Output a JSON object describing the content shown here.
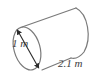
{
  "figure": {
    "name": "cylinder-diagram",
    "shape": "cylinder",
    "background_color": "#ffffff",
    "stroke_color": "#7a7a7a",
    "arrow_color": "#2b2b2b",
    "text_color": "#3c3c3c",
    "labels": {
      "diameter": "1 m",
      "length": "2.1 m"
    },
    "annotations": {
      "diameter_arrow": "double-headed-arrow",
      "diameter_value": 1,
      "diameter_unit": "m",
      "length_value": 2.1,
      "length_unit": "m"
    }
  }
}
